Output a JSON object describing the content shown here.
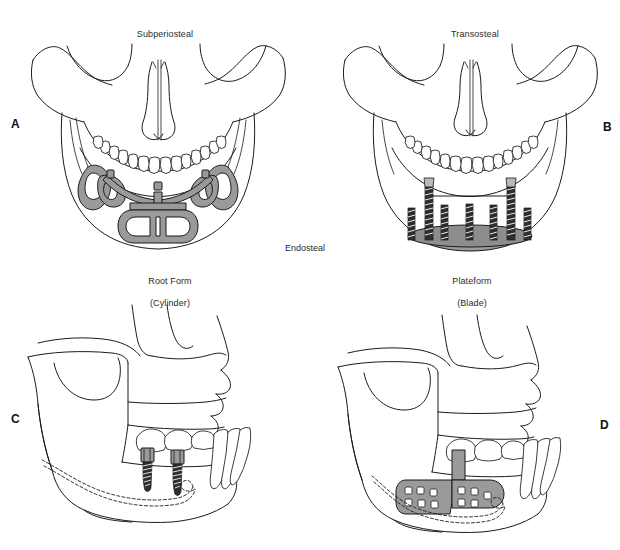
{
  "figure": {
    "caption_group_label": "Endosteal",
    "panels": [
      {
        "letter": "A",
        "title": "Subperiosteal",
        "subtitle": "",
        "view": "frontal mandible",
        "implant_name": "subperiosteal-framework",
        "implant_color": "#9a9a9a"
      },
      {
        "letter": "B",
        "title": "Transosteal",
        "subtitle": "",
        "view": "frontal mandible",
        "implant_name": "transosteal-staple-posts",
        "implant_color": "#2e2e2e"
      },
      {
        "letter": "C",
        "title": "Root Form",
        "subtitle": "(Cylinder)",
        "view": "lateral skull",
        "implant_name": "root-form-cylinder-implants",
        "implant_color": "#2e2e2e"
      },
      {
        "letter": "D",
        "title": "Plateform",
        "subtitle": "(Blade)",
        "view": "lateral skull",
        "implant_name": "blade-plate-implant",
        "implant_color": "#9a9a9a"
      }
    ]
  },
  "colors": {
    "background": "#ffffff",
    "outline": "#1b1b1b",
    "metal_mid": "#9a9a9a",
    "metal_dark": "#2e2e2e",
    "metal_light": "#b9b9b9",
    "text": "#2b2b2b"
  }
}
